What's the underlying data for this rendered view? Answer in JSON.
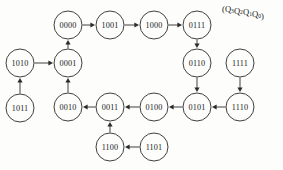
{
  "diagram": {
    "title_label": "(Q3Q2Q1Q0)",
    "header": {
      "open_paren": "(",
      "close_paren": ")",
      "vars": [
        {
          "name": "Q",
          "sub": "3"
        },
        {
          "name": "Q",
          "sub": "2"
        },
        {
          "name": "Q",
          "sub": "1"
        },
        {
          "name": "Q",
          "sub": "0"
        }
      ]
    },
    "node_radius": 14,
    "stroke_color": "#2b2b2b",
    "background_color": "#fdfdfc",
    "nodes": [
      {
        "id": "0000",
        "label": "0000",
        "cx": 68,
        "cy": 25
      },
      {
        "id": "1001",
        "label": "1001",
        "cx": 110,
        "cy": 25
      },
      {
        "id": "1000",
        "label": "1000",
        "cx": 154,
        "cy": 25
      },
      {
        "id": "0111",
        "label": "0111",
        "cx": 197,
        "cy": 25
      },
      {
        "id": "1010",
        "label": "1010",
        "cx": 20,
        "cy": 63
      },
      {
        "id": "0001",
        "label": "0001",
        "cx": 68,
        "cy": 63
      },
      {
        "id": "0110",
        "label": "0110",
        "cx": 197,
        "cy": 63
      },
      {
        "id": "1111",
        "label": "1111",
        "cx": 240,
        "cy": 63
      },
      {
        "id": "1011",
        "label": "1011",
        "cx": 20,
        "cy": 108
      },
      {
        "id": "0010",
        "label": "0010",
        "cx": 68,
        "cy": 107
      },
      {
        "id": "0011",
        "label": "0011",
        "cx": 110,
        "cy": 107
      },
      {
        "id": "0100",
        "label": "0100",
        "cx": 154,
        "cy": 107
      },
      {
        "id": "0101",
        "label": "0101",
        "cx": 197,
        "cy": 107
      },
      {
        "id": "1110",
        "label": "1110",
        "cx": 240,
        "cy": 107
      },
      {
        "id": "1100",
        "label": "1100",
        "cx": 110,
        "cy": 147
      },
      {
        "id": "1101",
        "label": "1101",
        "cx": 154,
        "cy": 147
      }
    ],
    "edges": [
      {
        "from": "0000",
        "to": "1001"
      },
      {
        "from": "1001",
        "to": "1000"
      },
      {
        "from": "1000",
        "to": "0111"
      },
      {
        "from": "0111",
        "to": "0110"
      },
      {
        "from": "0110",
        "to": "0101"
      },
      {
        "from": "0101",
        "to": "0100"
      },
      {
        "from": "0100",
        "to": "0011"
      },
      {
        "from": "0011",
        "to": "0010"
      },
      {
        "from": "0010",
        "to": "0001"
      },
      {
        "from": "0001",
        "to": "0000"
      },
      {
        "from": "1011",
        "to": "1010"
      },
      {
        "from": "1010",
        "to": "0001"
      },
      {
        "from": "1111",
        "to": "1110"
      },
      {
        "from": "1110",
        "to": "0101"
      },
      {
        "from": "1101",
        "to": "1100"
      },
      {
        "from": "1100",
        "to": "0011"
      }
    ]
  }
}
